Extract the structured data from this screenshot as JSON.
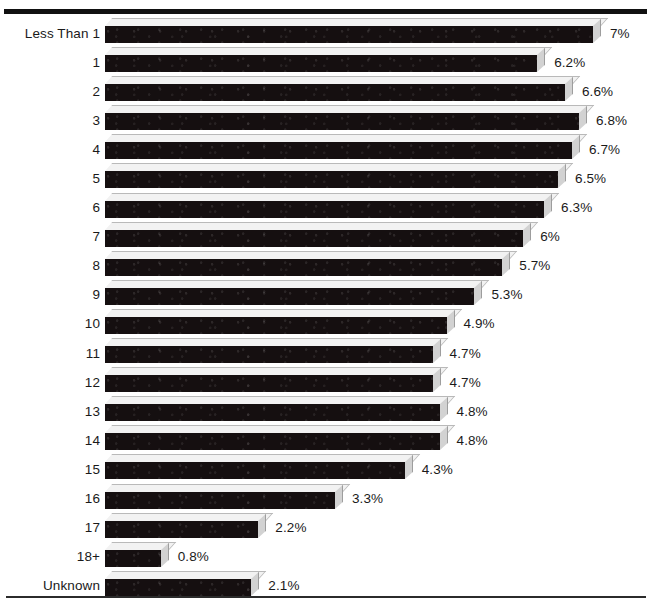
{
  "chart_data": {
    "type": "bar",
    "orientation": "horizontal",
    "title": "",
    "subtitle": "",
    "xlabel": "",
    "ylabel": "",
    "grid": false,
    "legend": null,
    "xlim": [
      0,
      7
    ],
    "value_suffix": "%",
    "categories": [
      "Less Than 1",
      "1",
      "2",
      "3",
      "4",
      "5",
      "6",
      "7",
      "8",
      "9",
      "10",
      "11",
      "12",
      "13",
      "14",
      "15",
      "16",
      "17",
      "18+",
      "Unknown"
    ],
    "values": [
      7,
      6.2,
      6.6,
      6.8,
      6.7,
      6.5,
      6.3,
      6,
      5.7,
      5.3,
      4.9,
      4.7,
      4.7,
      4.8,
      4.8,
      4.3,
      3.3,
      2.2,
      0.8,
      2.1
    ],
    "data_labels": [
      "7%",
      "6.2%",
      "6.6%",
      "6.8%",
      "6.7%",
      "6.5%",
      "6.3%",
      "6%",
      "5.7%",
      "5.3%",
      "4.9%",
      "4.7%",
      "4.7%",
      "4.8%",
      "4.8%",
      "4.3%",
      "3.3%",
      "2.2%",
      "0.8%",
      "2.1%"
    ]
  },
  "style": {
    "bar_color": "#150f10",
    "bar_top_face_color": "#f2f2f2",
    "bar_side_face_color": "#d2d2d2",
    "background_color": "#ffffff",
    "text_color": "#1a1a1a",
    "rule_color": "#111111"
  }
}
